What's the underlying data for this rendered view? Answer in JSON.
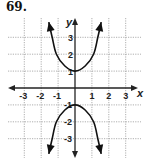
{
  "problem": {
    "number": "69."
  },
  "chart_data": {
    "type": "line",
    "title": "",
    "xlabel": "x",
    "ylabel": "y",
    "xlim": [
      -3.5,
      3.8
    ],
    "ylim": [
      -4,
      4
    ],
    "grid": true,
    "x_ticks": [
      "-3",
      "-2",
      "-1",
      "1",
      "2",
      "3"
    ],
    "y_ticks": [
      "3",
      "2",
      "1",
      "-1",
      "-2",
      "-3"
    ],
    "series": [
      {
        "name": "upper branch",
        "points": [
          [
            -1.55,
            3.9
          ],
          [
            -1.35,
            3.0
          ],
          [
            -1.1,
            2.0
          ],
          [
            -0.6,
            1.3
          ],
          [
            0,
            1
          ],
          [
            0.6,
            1.3
          ],
          [
            1.1,
            2.0
          ],
          [
            1.35,
            3.0
          ],
          [
            1.55,
            3.9
          ]
        ]
      },
      {
        "name": "lower branch",
        "points": [
          [
            -1.55,
            -3.9
          ],
          [
            -1.35,
            -3.0
          ],
          [
            -1.1,
            -2.0
          ],
          [
            -0.6,
            -1.3
          ],
          [
            0,
            -1
          ],
          [
            0.6,
            -1.3
          ],
          [
            1.1,
            -2.0
          ],
          [
            1.35,
            -3.0
          ],
          [
            1.55,
            -3.9
          ]
        ]
      }
    ],
    "annotations": [
      "vertices at (0, 1) and (0, -1)",
      "arrows on both ends of each branch"
    ]
  },
  "colors": {
    "grid": "#9a9a9a",
    "axis": "#222222",
    "curve": "#111111"
  }
}
